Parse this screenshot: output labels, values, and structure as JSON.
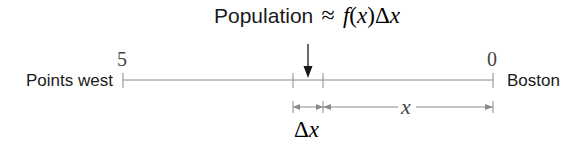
{
  "title": {
    "word": "Population",
    "approx_symbol": "≈",
    "formula_f": "f",
    "formula_open": "(",
    "formula_x": "x",
    "formula_close": ")",
    "formula_delta": "Δ",
    "formula_dx": "x"
  },
  "axis": {
    "left_label": "Points west",
    "right_label": "Boston",
    "left_value": "5",
    "right_value": "0"
  },
  "dimensions": {
    "x_label": "x",
    "delta_symbol": "Δ",
    "delta_var": "x"
  },
  "colors": {
    "line": "#8a8a8a",
    "arrow": "#1a1a1a",
    "text": "#1a1a1a"
  }
}
